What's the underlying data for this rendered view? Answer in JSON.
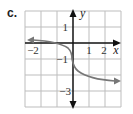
{
  "panel": {
    "label": "c."
  },
  "graph": {
    "x_label": "x",
    "y_label": "y",
    "x_ticks": [
      "−2",
      "1",
      "2"
    ],
    "y_ticks": [
      "1",
      "−1",
      "−3"
    ],
    "x_range": [
      -3,
      3
    ],
    "y_range": [
      -4,
      2
    ],
    "grid_color": "#bdbdbd",
    "axis_color": "#111111",
    "curve_color": "#777777"
  }
}
